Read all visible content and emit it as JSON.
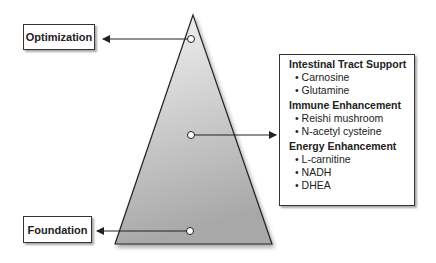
{
  "levels": {
    "top": {
      "label": "Optimization"
    },
    "middle": {
      "label": ""
    },
    "bottom": {
      "label": "Foundation"
    }
  },
  "info_box": {
    "sections": [
      {
        "title": "Intestinal Tract Support",
        "items": [
          "Carnosine",
          "Glutamine"
        ]
      },
      {
        "title": "Immune Enhancement",
        "items": [
          "Reishi mushroom",
          "N-acetyl cysteine"
        ]
      },
      {
        "title": "Energy Enhancement",
        "items": [
          "L-carnitine",
          "NADH",
          "DHEA"
        ]
      }
    ]
  },
  "colors": {
    "triangle_top": "#f4f4f4",
    "triangle_bottom": "#a8a8a8",
    "stroke": "#222222"
  }
}
